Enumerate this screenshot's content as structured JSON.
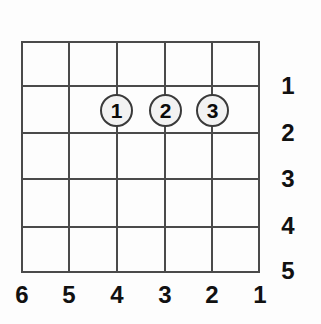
{
  "diagram": {
    "kind": "guitar-chord-diagram",
    "background_color": "#fdfdfd",
    "line_color": "#4a4a4a",
    "text_color": "#111111",
    "dot_fill_color": "#f2f2f2",
    "dot_border_color": "#3a3a3a",
    "strings_count": 6,
    "frets_count": 5
  },
  "fret_labels": [
    {
      "label": "1",
      "y": 85
    },
    {
      "label": "2",
      "y": 132
    },
    {
      "label": "3",
      "y": 178
    },
    {
      "label": "4",
      "y": 226
    },
    {
      "label": "5",
      "y": 273
    }
  ],
  "string_labels": [
    {
      "label": "6",
      "x": 21
    },
    {
      "label": "5",
      "x": 69
    },
    {
      "label": "4",
      "x": 117
    },
    {
      "label": "3",
      "x": 165
    },
    {
      "label": "2",
      "x": 212
    },
    {
      "label": "1",
      "x": 260
    }
  ],
  "finger_dots": [
    {
      "label": "1",
      "string": "4",
      "fret": "2",
      "cx": 116,
      "cy": 110
    },
    {
      "label": "2",
      "string": "3",
      "fret": "2",
      "cx": 165,
      "cy": 110
    },
    {
      "label": "3",
      "string": "2",
      "fret": "2",
      "cx": 212,
      "cy": 110
    }
  ],
  "grid": {
    "string_x": [
      0,
      47,
      95,
      143,
      190,
      237
    ],
    "fret_y": [
      0,
      44,
      91,
      137,
      185,
      230
    ]
  }
}
